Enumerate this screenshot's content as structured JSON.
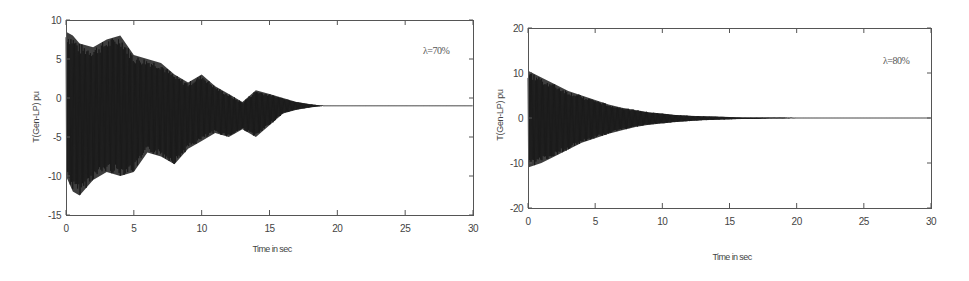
{
  "chart_data": [
    {
      "type": "line",
      "title": "",
      "annotation": "λ=70%",
      "xlabel": "Time in sec",
      "ylabel": "T(Gen-LP) pu",
      "xlim": [
        0,
        30
      ],
      "ylim": [
        -15,
        10
      ],
      "xticks": [
        "0",
        "5",
        "10",
        "15",
        "20",
        "25",
        "30"
      ],
      "yticks": [
        "10",
        "5",
        "0",
        "-5",
        "-10",
        "-15"
      ],
      "grid": false,
      "description": "Oscillating torque, dense signal; envelope decays to ~0 by ~17-18 s",
      "envelope": {
        "t": [
          0,
          0.5,
          1,
          2,
          3,
          4,
          5,
          6,
          7,
          8,
          9,
          10,
          11,
          12,
          13,
          14,
          15,
          16,
          17,
          18,
          19,
          20,
          25,
          30
        ],
        "upper": [
          8.5,
          8,
          7,
          6.5,
          7.5,
          8,
          5.5,
          5,
          4.5,
          3,
          2,
          3,
          1.5,
          0.5,
          -0.5,
          1,
          0.5,
          0,
          -0.5,
          -0.8,
          -1,
          -1,
          -1,
          -1
        ],
        "lower": [
          -10,
          -12,
          -12.5,
          -10.5,
          -9.5,
          -10,
          -9.5,
          -7,
          -7.5,
          -8.5,
          -6.5,
          -5.5,
          -4.5,
          -5,
          -4,
          -5,
          -3.5,
          -2,
          -1.5,
          -1.2,
          -1,
          -1,
          -1,
          -1
        ]
      }
    },
    {
      "type": "line",
      "title": "",
      "annotation": "λ=80%",
      "xlabel": "Time in sec",
      "ylabel": "T(Gen-LP) pu",
      "xlim": [
        0,
        30
      ],
      "ylim": [
        -20,
        20
      ],
      "xticks": [
        "0",
        "5",
        "10",
        "15",
        "20",
        "25",
        "30"
      ],
      "yticks": [
        "20",
        "10",
        "0",
        "-10",
        "-20"
      ],
      "grid": false,
      "description": "Oscillating torque with smooth exponential decay envelope, settled by ~15-19 s",
      "envelope": {
        "t": [
          0,
          1,
          2,
          3,
          4,
          5,
          6,
          7,
          8,
          9,
          10,
          11,
          12,
          13,
          14,
          15,
          16,
          17,
          18,
          19,
          20,
          25,
          30
        ],
        "upper": [
          10.5,
          9,
          7.5,
          6,
          5,
          4,
          3,
          2.3,
          1.8,
          1.3,
          1,
          0.7,
          0.5,
          0.4,
          0.3,
          0.2,
          0.1,
          0.1,
          0.1,
          0.1,
          0,
          0,
          0
        ],
        "lower": [
          -11,
          -10,
          -8.5,
          -7,
          -5.5,
          -4.5,
          -3.5,
          -2.7,
          -2,
          -1.5,
          -1.2,
          -0.9,
          -0.7,
          -0.5,
          -0.4,
          -0.3,
          -0.2,
          -0.2,
          -0.1,
          -0.1,
          0,
          0,
          0
        ]
      }
    }
  ]
}
